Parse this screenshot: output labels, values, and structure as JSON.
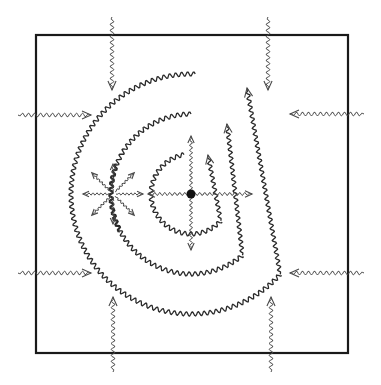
{
  "diagram": {
    "colors": {
      "stroke": "#2a2a2a",
      "background": "#ffffff",
      "source_dot": "#111111"
    },
    "box": {
      "x": 36,
      "y": 35,
      "width": 312,
      "height": 318
    },
    "source": {
      "cx": 191,
      "cy": 194,
      "r": 4.5
    },
    "circles": [
      {
        "name": "inner",
        "r": 40,
        "start_deg": -95,
        "end_deg": 210,
        "arrow": true,
        "arrow_tip": [
          208,
          155
        ]
      },
      {
        "name": "middle",
        "r": 80,
        "start_deg": -90,
        "end_deg": 215,
        "gap": [
          168,
          200
        ],
        "arrow": true,
        "arrow_tip": [
          227,
          124
        ]
      },
      {
        "name": "outer",
        "r": 120,
        "start_deg": -90,
        "end_deg": 215,
        "arrow": true,
        "arrow_tip": [
          247,
          88
        ]
      }
    ],
    "source_rays": [
      {
        "dir": "up",
        "to": [
          191,
          136
        ]
      },
      {
        "dir": "down",
        "to": [
          191,
          250
        ]
      },
      {
        "dir": "left",
        "to": [
          148,
          194
        ]
      },
      {
        "dir": "right",
        "to": [
          252,
          194
        ]
      }
    ],
    "starburst": {
      "cx": 113,
      "cy": 194,
      "length": 30,
      "rays": 8
    },
    "incoming_arrows": [
      {
        "side": "top",
        "from": [
          112,
          17
        ],
        "to": [
          112,
          90
        ]
      },
      {
        "side": "top",
        "from": [
          268,
          17
        ],
        "to": [
          268,
          90
        ]
      },
      {
        "side": "left",
        "from": [
          18,
          115
        ],
        "to": [
          91,
          115
        ]
      },
      {
        "side": "left",
        "from": [
          18,
          273
        ],
        "to": [
          91,
          273
        ]
      },
      {
        "side": "right",
        "from": [
          364,
          114
        ],
        "to": [
          290,
          114
        ]
      },
      {
        "side": "right",
        "from": [
          364,
          273
        ],
        "to": [
          290,
          273
        ]
      },
      {
        "side": "bottom",
        "from": [
          113,
          372
        ],
        "to": [
          113,
          297
        ]
      },
      {
        "side": "bottom",
        "from": [
          271,
          372
        ],
        "to": [
          271,
          297
        ]
      }
    ]
  }
}
